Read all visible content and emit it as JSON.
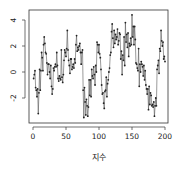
{
  "chart_data": {
    "type": "line",
    "title": "",
    "xlabel": "지수",
    "ylabel": "",
    "xlim": [
      0,
      200
    ],
    "ylim": [
      -3.8,
      4.7
    ],
    "grid": false,
    "legend": null,
    "x_ticks": [
      0,
      50,
      100,
      150,
      200
    ],
    "x_tick_labels": [
      "0",
      "50",
      "100",
      "150",
      "200"
    ],
    "y_ticks": [
      -2,
      0,
      2,
      4
    ],
    "y_tick_labels": [
      "-2",
      "0",
      "2",
      "4"
    ],
    "style": {
      "line_color": "#555555",
      "marker_color": "#222222",
      "marker": "filled-circle"
    },
    "series": [
      {
        "name": "series",
        "x": [
          1,
          2,
          3,
          4,
          5,
          6,
          7,
          8,
          9,
          10,
          11,
          12,
          13,
          14,
          15,
          16,
          17,
          18,
          19,
          20,
          21,
          22,
          23,
          24,
          25,
          26,
          27,
          28,
          29,
          30,
          31,
          32,
          33,
          34,
          35,
          36,
          37,
          38,
          39,
          40,
          41,
          42,
          43,
          44,
          45,
          46,
          47,
          48,
          49,
          50,
          51,
          52,
          53,
          54,
          55,
          56,
          57,
          58,
          59,
          60,
          61,
          62,
          63,
          64,
          65,
          66,
          67,
          68,
          69,
          70,
          71,
          72,
          73,
          74,
          75,
          76,
          77,
          78,
          79,
          80,
          81,
          82,
          83,
          84,
          85,
          86,
          87,
          88,
          89,
          90,
          91,
          92,
          93,
          94,
          95,
          96,
          97,
          98,
          99,
          100,
          101,
          102,
          103,
          104,
          105,
          106,
          107,
          108,
          109,
          110,
          111,
          112,
          113,
          114,
          115,
          116,
          117,
          118,
          119,
          120,
          121,
          122,
          123,
          124,
          125,
          126,
          127,
          128,
          129,
          130,
          131,
          132,
          133,
          134,
          135,
          136,
          137,
          138,
          139,
          140,
          141,
          142,
          143,
          144,
          145,
          146,
          147,
          148,
          149,
          150,
          151,
          152,
          153,
          154,
          155,
          156,
          157,
          158,
          159,
          160,
          161,
          162,
          163,
          164,
          165,
          166,
          167,
          168,
          169,
          170,
          171,
          172,
          173,
          174,
          175,
          176,
          177,
          178,
          179,
          180,
          181,
          182,
          183,
          184,
          185,
          186,
          187,
          188,
          189,
          190,
          191,
          192,
          193,
          194,
          195,
          196,
          197,
          198,
          199,
          200
        ],
        "values": [
          -0.5,
          -0.2,
          0.1,
          -1.2,
          -1.4,
          -1.9,
          -1.3,
          -3.2,
          -1.6,
          0.2,
          -1.4,
          0.1,
          1.5,
          1.1,
          0.1,
          2.1,
          2.7,
          2.2,
          1.5,
          1.4,
          0.7,
          -0.2,
          0.6,
          0.6,
          0.0,
          -0.5,
          0.5,
          -1.1,
          -1.7,
          -1.3,
          0.3,
          0.1,
          0.4,
          0.6,
          0.4,
          1.5,
          0.5,
          -0.5,
          -0.7,
          -0.3,
          -0.5,
          -0.6,
          1.7,
          -0.4,
          -0.8,
          -0.2,
          0.9,
          1.7,
          1.5,
          1.2,
          1.8,
          3.2,
          1.7,
          0.9,
          0.5,
          -0.1,
          1.0,
          1.0,
          0.2,
          0.4,
          0.6,
          0.3,
          1.0,
          0.7,
          2.1,
          2.8,
          1.6,
          1.9,
          1.7,
          2.0,
          2.2,
          1.5,
          0.6,
          1.5,
          1.7,
          -1.4,
          -3.5,
          -1.2,
          -2.3,
          -3.3,
          -2.1,
          -2.6,
          -3.4,
          -2.7,
          -0.6,
          -1.8,
          -0.6,
          -1.9,
          0.2,
          -0.3,
          -0.5,
          0.4,
          -0.2,
          -1.0,
          0.5,
          0.0,
          2.3,
          2.1,
          1.5,
          2.1,
          1.4,
          1.1,
          0.2,
          -1.0,
          -1.7,
          -1.6,
          -2.4,
          -2.8,
          -1.5,
          -1.4,
          -0.4,
          -1.9,
          -0.9,
          -0.6,
          0.0,
          0.3,
          1.3,
          1.5,
          3.1,
          3.7,
          2.6,
          1.9,
          3.2,
          2.2,
          2.9,
          2.5,
          2.7,
          3.3,
          2.1,
          2.4,
          3.0,
          2.9,
          1.0,
          1.6,
          -0.2,
          1.3,
          0.9,
          2.7,
          0.5,
          3.8,
          2.3,
          2.9,
          1.9,
          3.0,
          1.2,
          2.2,
          2.0,
          2.6,
          2.1,
          4.4,
          2.7,
          3.5,
          2.1,
          3.5,
          2.5,
          0.7,
          0.6,
          0.3,
          0.1,
          1.8,
          -1.1,
          0.6,
          0.0,
          0.8,
          0.6,
          0.4,
          -0.3,
          0.5,
          -0.6,
          0.1,
          -1.0,
          -1.3,
          -1.7,
          -1.3,
          -2.9,
          -1.1,
          -2.5,
          -1.6,
          -1.8,
          -2.6,
          -2.5,
          -2.7,
          -2.3,
          -3.4,
          -2.6,
          -2.0,
          -2.6,
          0.2,
          0.5,
          0.9,
          -0.1,
          1.8,
          1.6,
          3.2,
          2.4,
          2.0,
          2.3,
          1.0,
          1.2,
          0.8
        ]
      }
    ],
    "plot_area_px": {
      "left": 29,
      "right": 168,
      "top": 10,
      "bottom": 123
    }
  }
}
